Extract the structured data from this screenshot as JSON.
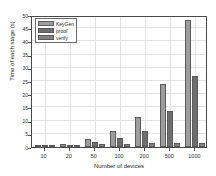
{
  "chart_data": {
    "type": "bar",
    "title": "",
    "xlabel": "Number of devices",
    "ylabel": "Time of each stage (s)",
    "categories": [
      "10",
      "20",
      "50",
      "100",
      "200",
      "500",
      "1000"
    ],
    "series": [
      {
        "name": "KeyGen",
        "color": "#9d9d9d",
        "values": [
          0.6,
          1.1,
          3.0,
          5.9,
          11.2,
          24.0,
          48.0
        ]
      },
      {
        "name": "proof",
        "color": "#6e6e6e",
        "values": [
          0.5,
          0.8,
          1.8,
          3.3,
          6.2,
          13.5,
          26.8
        ]
      },
      {
        "name": "verify",
        "color": "#828282",
        "values": [
          0.4,
          0.5,
          1.2,
          1.3,
          1.4,
          1.5,
          1.6
        ]
      }
    ],
    "ylim": [
      0,
      50
    ],
    "yticks": [
      0,
      5,
      10,
      15,
      20,
      25,
      30,
      35,
      40,
      45,
      50
    ],
    "grid": true,
    "legend_position": "top-left"
  }
}
